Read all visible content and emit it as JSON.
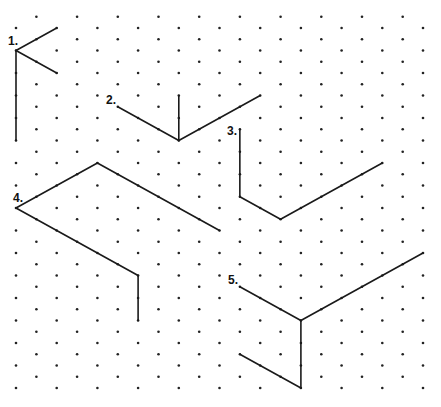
{
  "grid": {
    "type": "isometric-dot",
    "origin_x": 16,
    "origin_y": 5.5,
    "dx": 20.35,
    "dy": 11.25,
    "cols": 21,
    "k_min": 1,
    "k_max": 34,
    "dot_color": "#222222",
    "line_color": "#1a1a1a"
  },
  "figures": [
    {
      "label": "1.",
      "label_pos": [
        8,
        45
      ],
      "segments": [
        [
          [
            0,
            4
          ],
          [
            2,
            2
          ]
        ],
        [
          [
            0,
            4
          ],
          [
            2,
            6
          ]
        ],
        [
          [
            0,
            4
          ],
          [
            0,
            12
          ]
        ]
      ]
    },
    {
      "label": "2.",
      "label_pos": [
        106,
        104
      ],
      "segments": [
        [
          [
            5,
            9
          ],
          [
            8,
            12
          ]
        ],
        [
          [
            8,
            12
          ],
          [
            8,
            8
          ]
        ],
        [
          [
            8,
            12
          ],
          [
            12,
            8
          ]
        ]
      ]
    },
    {
      "label": "3.",
      "label_pos": [
        227,
        135
      ],
      "segments": [
        [
          [
            11,
            11
          ],
          [
            11,
            17
          ]
        ],
        [
          [
            11,
            17
          ],
          [
            13,
            19
          ]
        ],
        [
          [
            13,
            19
          ],
          [
            18,
            14
          ]
        ]
      ]
    },
    {
      "label": "4.",
      "label_pos": [
        13,
        202
      ],
      "segments": [
        [
          [
            0,
            18
          ],
          [
            4,
            14
          ]
        ],
        [
          [
            4,
            14
          ],
          [
            10,
            20
          ]
        ],
        [
          [
            0,
            18
          ],
          [
            6,
            24
          ]
        ],
        [
          [
            6,
            24
          ],
          [
            6,
            28
          ]
        ]
      ]
    },
    {
      "label": "5.",
      "label_pos": [
        228,
        284
      ],
      "segments": [
        [
          [
            11,
            25
          ],
          [
            14,
            28
          ]
        ],
        [
          [
            14,
            28
          ],
          [
            20,
            22
          ]
        ],
        [
          [
            14,
            28
          ],
          [
            14,
            34
          ]
        ],
        [
          [
            11,
            31
          ],
          [
            14,
            34
          ]
        ]
      ]
    }
  ]
}
